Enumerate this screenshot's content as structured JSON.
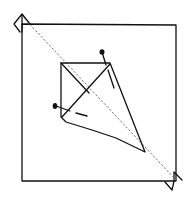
{
  "diagram": {
    "type": "origami-fold-sketch",
    "colors": {
      "stroke": "#111111",
      "background": "#ffffff",
      "fold_line": "#555555"
    },
    "square": {
      "x1": 22,
      "y1": 24,
      "x2": 176,
      "y2": 181
    },
    "diagonal_fold": {
      "from": [
        20,
        15
      ],
      "to": [
        178,
        190
      ],
      "style": "dotted"
    },
    "kite": {
      "points": [
        [
          61,
          63
        ],
        [
          110,
          63
        ],
        [
          145,
          152
        ],
        [
          61,
          117
        ]
      ],
      "inner_lines": [
        [
          [
            61,
            63
          ],
          [
            89,
            93
          ]
        ],
        [
          [
            110,
            63
          ],
          [
            63,
            116
          ]
        ]
      ]
    },
    "markers": [
      {
        "name": "pin-top",
        "x": 102,
        "y": 52
      },
      {
        "name": "pin-left",
        "x": 55,
        "y": 106
      }
    ],
    "dashes": [
      [
        [
          108,
          68
        ],
        [
          114,
          88
        ]
      ],
      [
        [
          60,
          108
        ],
        [
          86,
          116
        ]
      ]
    ],
    "corner_flaps": [
      {
        "name": "top-left-flap",
        "points": [
          [
            14,
            23
          ],
          [
            23,
            14
          ],
          [
            31,
            23
          ],
          [
            20,
            32
          ]
        ]
      },
      {
        "name": "bottom-right-flap",
        "points": [
          [
            165,
            182
          ],
          [
            174,
            172
          ],
          [
            181,
            180
          ],
          [
            172,
            190
          ]
        ]
      }
    ]
  }
}
